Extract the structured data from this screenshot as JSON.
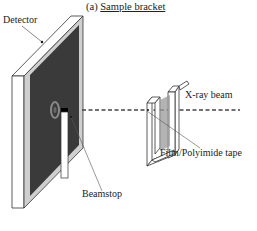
{
  "figure": {
    "title_prefix": "(a)",
    "title": "Sample bracket",
    "labels": {
      "detector": "Detector",
      "beamstop": "Beamstop",
      "xray_beam": "X-ray beam",
      "film": "Film/Polyimide tape"
    },
    "colors": {
      "detector_face": "#3a3a3a",
      "film_shade": "#9a9a9a",
      "line": "#333333"
    }
  }
}
